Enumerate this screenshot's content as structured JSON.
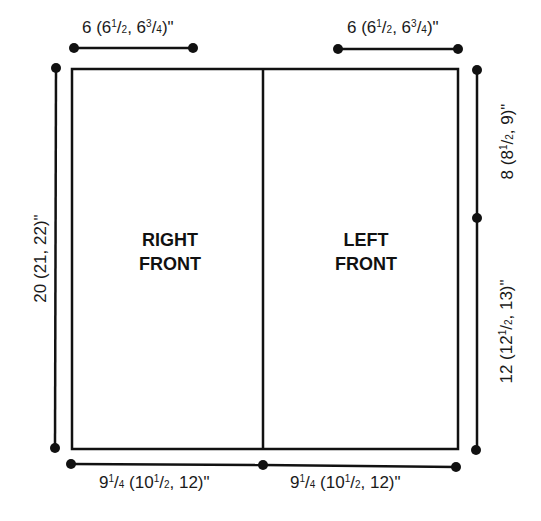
{
  "diagram": {
    "type": "knitting-schematic",
    "panels": [
      {
        "id": "right-front",
        "line1": "RIGHT",
        "line2": "FRONT"
      },
      {
        "id": "left-front",
        "line1": "LEFT",
        "line2": "FRONT"
      }
    ],
    "measurements": {
      "top_left": {
        "whole": "6 (6",
        "n1": "1",
        "d1": "2",
        "mid": ", 6",
        "n2": "3",
        "d2": "4",
        "end": ")\""
      },
      "top_right": {
        "whole": "6 (6",
        "n1": "1",
        "d1": "2",
        "mid": ", 6",
        "n2": "3",
        "d2": "4",
        "end": ")\""
      },
      "left_height": {
        "text": "20 (21, 22)\""
      },
      "right_upper": {
        "whole": "8 (8",
        "n1": "1",
        "d1": "2",
        "end": ", 9)\""
      },
      "right_lower": {
        "whole": "12 (12",
        "n1": "1",
        "d1": "2",
        "end": ", 13)\""
      },
      "bottom_left": {
        "whole": "9",
        "n0": "1",
        "d0": "4",
        "mid": " (10",
        "n1": "1",
        "d1": "2",
        "end": ", 12)\""
      },
      "bottom_right": {
        "whole": "9",
        "n0": "1",
        "d0": "4",
        "mid": " (10",
        "n1": "1",
        "d1": "2",
        "end": ", 12)\""
      }
    },
    "colors": {
      "line": "#111111",
      "background": "#ffffff"
    }
  }
}
